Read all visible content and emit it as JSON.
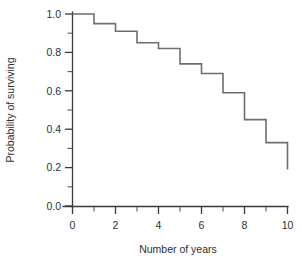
{
  "chart_data": {
    "type": "line",
    "title": "",
    "subtitle": "",
    "xlabel": "Number of years",
    "ylabel": "Probability of surviving",
    "xlim": [
      0,
      10
    ],
    "ylim": [
      0.0,
      1.0
    ],
    "grid": false,
    "legend": null,
    "legend_position": "none",
    "style": "step-post",
    "annotations": [],
    "x_ticks_major": [
      0,
      2,
      4,
      6,
      8,
      10
    ],
    "x_tick_labels": [
      "0",
      "2",
      "4",
      "6",
      "8",
      "10"
    ],
    "x_ticks_minor": [
      1,
      3,
      5,
      7,
      9
    ],
    "y_ticks_major": [
      0.0,
      0.2,
      0.4,
      0.6,
      0.8,
      1.0
    ],
    "y_tick_labels": [
      "0.0",
      "0.2",
      "0.4",
      "0.6",
      "0.8",
      "1.0"
    ],
    "y_ticks_minor": [
      0.1,
      0.3,
      0.5,
      0.7,
      0.9
    ],
    "x": [
      0,
      1,
      2,
      3,
      4,
      5,
      6,
      7,
      8,
      9,
      10
    ],
    "values": [
      1.0,
      0.95,
      0.91,
      0.85,
      0.82,
      0.74,
      0.69,
      0.59,
      0.45,
      0.33,
      0.19
    ],
    "series": [
      {
        "name": "Survival probability",
        "color": "#6e6e6e",
        "x": [
          0,
          1,
          2,
          3,
          4,
          5,
          6,
          7,
          8,
          9,
          10
        ],
        "values": [
          1.0,
          0.95,
          0.91,
          0.85,
          0.82,
          0.74,
          0.69,
          0.59,
          0.45,
          0.33,
          0.19
        ]
      }
    ]
  },
  "colors": {
    "curve": "#6e6e6e",
    "axis": "#3a3a3a",
    "text": "#2e2e2e",
    "background": "#ffffff"
  }
}
